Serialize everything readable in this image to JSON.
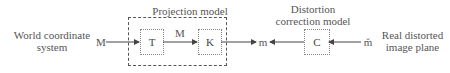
{
  "left_label": {
    "line1": "World coordinate",
    "line2": "system"
  },
  "projection_title": "Projection model",
  "distortion_title": {
    "line1": "Distortion",
    "line2": "correction model"
  },
  "right_label": {
    "line1": "Real distorted",
    "line2": "image plane"
  },
  "symbols": {
    "M_in": "M",
    "M_mid": "M",
    "m_out": "m",
    "m_distorted": "m̆"
  },
  "boxes": {
    "T": "T",
    "K": "K",
    "C": "C"
  }
}
